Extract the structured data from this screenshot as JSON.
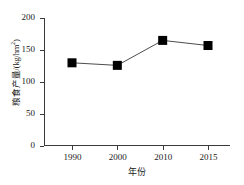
{
  "chart_data": {
    "type": "line",
    "title": "",
    "subtitle": "",
    "xlabel": "年份",
    "ylabel": "粮食产量/(kg/hm2)",
    "ylabel_main": "粮食产量/(kg/hm",
    "ylabel_sup": "2",
    "ylabel_tail": ")",
    "categories": [
      "1990",
      "2000",
      "2010",
      "2015"
    ],
    "x": [
      1990,
      2000,
      2010,
      2015
    ],
    "values": [
      130,
      126,
      165,
      157
    ],
    "series": [
      {
        "name": "粮食产量",
        "values": [
          130,
          126,
          165,
          157
        ]
      }
    ],
    "ylim": [
      0,
      200
    ],
    "yticks": [
      0,
      50,
      100,
      150,
      200
    ],
    "ytick_labels": [
      "0",
      "50",
      "100",
      "150",
      "200"
    ],
    "xtick_labels": [
      "1990",
      "2000",
      "2010",
      "2015"
    ],
    "grid": false,
    "legend": false,
    "legend_position": "none",
    "marker": "square",
    "marker_color": "#000000",
    "line_color": "#4d4d4d",
    "axis_color": "#3a3a3a",
    "background": "#ffffff",
    "annotations": []
  }
}
